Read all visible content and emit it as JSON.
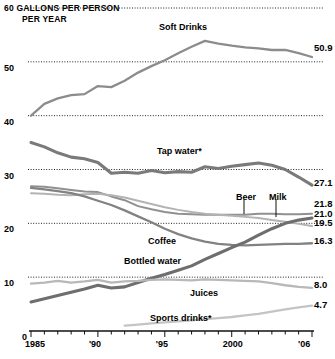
{
  "header": {
    "line1": "60  GALLONS PER PERSON",
    "line2": "PER YEAR"
  },
  "chart_data": {
    "type": "line",
    "title": "GALLONS PER PERSON PER YEAR",
    "subtitle": "PER YEAR",
    "xlabel": "",
    "ylabel": "Gallons per person per year",
    "xlim": [
      1985,
      2006
    ],
    "ylim": [
      0,
      60
    ],
    "grid": true,
    "grid_style": "dotted-horizontal",
    "legend_position": "inline-annotations",
    "yticks": [
      "60",
      "50",
      "40",
      "30",
      "20",
      "10",
      "0"
    ],
    "ytick_values": [
      60,
      50,
      40,
      30,
      20,
      10,
      0
    ],
    "xticks": [
      "1985",
      "'90",
      "'95",
      "2000",
      "'06"
    ],
    "xtick_values": [
      1985,
      1990,
      1995,
      2000,
      2006
    ],
    "x": [
      1985,
      1986,
      1987,
      1988,
      1989,
      1990,
      1991,
      1992,
      1993,
      1994,
      1995,
      1996,
      1997,
      1998,
      1999,
      2000,
      2001,
      2002,
      2003,
      2004,
      2005,
      2006
    ],
    "series": [
      {
        "name": "Soft Drinks",
        "label": "Soft Drinks",
        "end_value": "50.9",
        "end_value_num": 50.9,
        "emphasis": "normal",
        "color": "#8c8c8c",
        "values": [
          40.0,
          42.2,
          43.2,
          43.8,
          44.0,
          45.5,
          45.3,
          46.5,
          48.0,
          49.2,
          50.3,
          51.6,
          52.8,
          53.9,
          53.4,
          53.0,
          52.7,
          52.5,
          52.2,
          52.2,
          51.6,
          50.9
        ]
      },
      {
        "name": "Tap water",
        "label": "Tap water*",
        "end_value": "27.1",
        "end_value_num": 27.1,
        "emphasis": "bold",
        "color": "#7a7a7a",
        "values": [
          35.0,
          34.2,
          33.1,
          32.3,
          32.0,
          31.3,
          29.3,
          29.5,
          29.3,
          29.8,
          29.4,
          29.6,
          29.5,
          30.5,
          30.2,
          30.6,
          30.9,
          31.2,
          30.8,
          30.0,
          28.6,
          27.1
        ]
      },
      {
        "name": "Beer",
        "label": "Beer",
        "end_value": "21.8",
        "end_value_num": 21.8,
        "emphasis": "callout",
        "color": "#909090",
        "values": [
          26.9,
          26.8,
          26.5,
          26.2,
          25.9,
          25.8,
          25.0,
          24.3,
          23.2,
          22.6,
          22.1,
          21.8,
          21.7,
          21.6,
          21.6,
          21.6,
          21.6,
          21.8,
          21.8,
          21.7,
          21.7,
          21.8
        ]
      },
      {
        "name": "Milk",
        "label": "Milk",
        "end_value": "19.5",
        "end_value_num": 19.5,
        "emphasis": "callout",
        "color": "#b3b3b3",
        "values": [
          25.6,
          25.5,
          25.3,
          25.2,
          25.4,
          25.5,
          25.2,
          24.8,
          24.2,
          23.6,
          23.0,
          22.5,
          22.1,
          21.8,
          21.6,
          21.4,
          21.2,
          21.0,
          20.6,
          20.3,
          19.9,
          19.5
        ]
      },
      {
        "name": "Coffee",
        "label": "Coffee",
        "end_value": "16.3",
        "end_value_num": 16.3,
        "emphasis": "normal",
        "color": "#828282",
        "values": [
          26.6,
          26.3,
          26.0,
          25.6,
          25.0,
          24.2,
          23.4,
          22.4,
          21.3,
          20.2,
          19.0,
          18.0,
          17.2,
          16.6,
          16.2,
          16.0,
          15.9,
          16.0,
          16.1,
          16.2,
          16.2,
          16.3
        ]
      },
      {
        "name": "Bottled water",
        "label": "Bottled water",
        "end_value": "21.0",
        "end_value_num": 21.0,
        "emphasis": "bold",
        "color": "#6e6e6e",
        "values": [
          5.4,
          6.0,
          6.6,
          7.2,
          7.8,
          8.5,
          8.0,
          8.2,
          9.0,
          9.8,
          10.5,
          11.3,
          12.1,
          13.3,
          14.4,
          15.5,
          16.5,
          17.8,
          19.0,
          20.0,
          20.6,
          21.0
        ]
      },
      {
        "name": "Juices",
        "label": "Juices",
        "end_value": "8.0",
        "end_value_num": 8.0,
        "emphasis": "normal",
        "color": "#b8b8b8",
        "values": [
          8.8,
          9.0,
          9.3,
          9.0,
          9.2,
          9.5,
          9.0,
          9.2,
          9.3,
          9.5,
          9.6,
          9.5,
          9.4,
          9.6,
          9.5,
          9.4,
          9.3,
          9.2,
          8.9,
          8.5,
          8.2,
          8.0
        ]
      },
      {
        "name": "Sports drinks",
        "label": "Sports drinks*",
        "end_value": "4.7",
        "end_value_num": 4.7,
        "emphasis": "normal",
        "color": "#c4c4c4",
        "values": [
          null,
          null,
          null,
          null,
          null,
          null,
          null,
          1.0,
          1.2,
          1.4,
          1.6,
          1.8,
          2.0,
          2.2,
          2.4,
          2.6,
          2.9,
          3.2,
          3.6,
          4.0,
          4.4,
          4.7
        ]
      }
    ],
    "annotations": [
      {
        "text": "Soft Drinks",
        "series": "Soft Drinks"
      },
      {
        "text": "Tap water*",
        "series": "Tap water"
      },
      {
        "text": "Beer",
        "series": "Beer"
      },
      {
        "text": "Milk",
        "series": "Milk"
      },
      {
        "text": "Coffee",
        "series": "Coffee"
      },
      {
        "text": "Bottled water",
        "series": "Bottled water"
      },
      {
        "text": "Juices",
        "series": "Juices"
      },
      {
        "text": "Sports drinks*",
        "series": "Sports drinks"
      }
    ]
  }
}
